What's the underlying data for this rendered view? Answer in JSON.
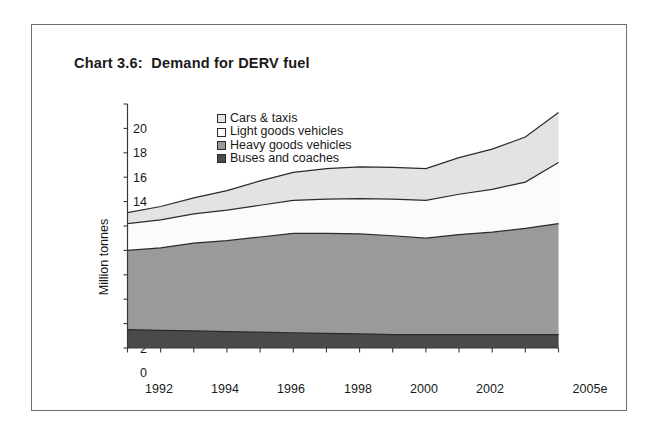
{
  "panel": {
    "title": "Chart 3.6:  Demand for DERV fuel"
  },
  "legend": {
    "position": "inside-top-left",
    "items": [
      {
        "label": "Cars & taxis",
        "color": "#e3e3e3",
        "swatch_name": "legend-swatch-cars-taxis"
      },
      {
        "label": "Light goods vehicles",
        "color": "#fbfbfb",
        "swatch_name": "legend-swatch-light-goods"
      },
      {
        "label": "Heavy goods vehicles",
        "color": "#9a9a9a",
        "swatch_name": "legend-swatch-heavy-goods"
      },
      {
        "label": "Buses and coaches",
        "color": "#4a4a4a",
        "swatch_name": "legend-swatch-buses-coaches"
      }
    ]
  },
  "axes": {
    "y_title": "Million tonnes",
    "y_ticks": [
      "20",
      "18",
      "16",
      "14",
      "12",
      "10",
      "8",
      "6",
      "4",
      "2",
      "0"
    ],
    "x_ticks": [
      "1992",
      "1994",
      "1996",
      "1998",
      "2000",
      "2002",
      "2005e"
    ]
  },
  "chart_data": {
    "type": "area",
    "stacked": true,
    "title": "Chart 3.6:  Demand for DERV fuel",
    "xlabel": "",
    "ylabel": "Million tonnes",
    "ylim": [
      0,
      20
    ],
    "ytick_step": 2,
    "grid": false,
    "legend_position": "inside-top-left",
    "x": [
      "1992",
      "1993",
      "1994",
      "1995",
      "1996",
      "1997",
      "1998",
      "1999",
      "2000",
      "2001",
      "2002",
      "2003",
      "2004",
      "2005e"
    ],
    "xtick_labels": [
      "1992",
      "1994",
      "1996",
      "1998",
      "2000",
      "2002",
      "2005e"
    ],
    "series": [
      {
        "name": "Buses and coaches",
        "color": "#4a4a4a",
        "values": [
          1.5,
          1.45,
          1.4,
          1.35,
          1.3,
          1.25,
          1.2,
          1.15,
          1.1,
          1.1,
          1.1,
          1.1,
          1.1,
          1.1
        ]
      },
      {
        "name": "Heavy goods vehicles",
        "color": "#9a9a9a",
        "values": [
          6.5,
          6.75,
          7.2,
          7.45,
          7.8,
          8.15,
          8.2,
          8.2,
          8.1,
          7.9,
          8.2,
          8.4,
          8.7,
          9.1
        ]
      },
      {
        "name": "Light goods vehicles",
        "color": "#fbfbfb",
        "values": [
          2.2,
          2.3,
          2.4,
          2.5,
          2.6,
          2.7,
          2.8,
          2.9,
          3.0,
          3.1,
          3.3,
          3.5,
          3.8,
          5.0
        ]
      },
      {
        "name": "Cars & taxis",
        "color": "#e3e3e3",
        "values": [
          0.9,
          1.1,
          1.3,
          1.6,
          2.0,
          2.3,
          2.5,
          2.6,
          2.6,
          2.6,
          3.0,
          3.3,
          3.7,
          4.1
        ]
      }
    ],
    "cumulative_tops": {
      "Buses and coaches": [
        1.5,
        1.45,
        1.4,
        1.35,
        1.3,
        1.25,
        1.2,
        1.15,
        1.1,
        1.1,
        1.1,
        1.1,
        1.1,
        1.1
      ],
      "Heavy goods vehicles": [
        8.0,
        8.2,
        8.6,
        8.8,
        9.1,
        9.4,
        9.4,
        9.35,
        9.2,
        9.0,
        9.3,
        9.5,
        9.8,
        10.2
      ],
      "Light goods vehicles": [
        10.2,
        10.5,
        11.0,
        11.3,
        11.7,
        12.1,
        12.2,
        12.25,
        12.2,
        12.1,
        12.6,
        13.0,
        13.6,
        15.2
      ],
      "Cars & taxis": [
        11.1,
        11.6,
        12.3,
        12.9,
        13.7,
        14.4,
        14.7,
        14.85,
        14.8,
        14.7,
        15.6,
        16.3,
        17.3,
        19.3
      ]
    }
  }
}
